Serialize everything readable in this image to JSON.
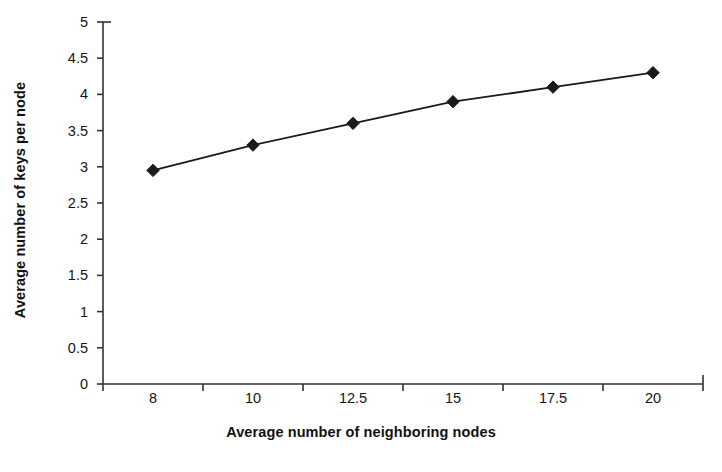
{
  "chart_data": {
    "type": "line",
    "title": "",
    "subtitle": "",
    "xlabel": "Average number of neighboring nodes",
    "ylabel": "Average number of keys per node",
    "categories": [
      "8",
      "10",
      "12.5",
      "15",
      "17.5",
      "20"
    ],
    "values": [
      2.95,
      3.3,
      3.6,
      3.9,
      4.1,
      4.3
    ],
    "series": [
      {
        "name": "Average number of keys per node",
        "values": [
          2.95,
          3.3,
          3.6,
          3.9,
          4.1,
          4.3
        ],
        "marker": "diamond",
        "color": "#1a1a1a"
      }
    ],
    "ylim": [
      0,
      5
    ],
    "y_tick_step": 0.5,
    "y_tick_labels": [
      "5",
      "4.5",
      "4",
      "3.5",
      "3",
      "2.5",
      "2",
      "1.5",
      "1",
      "0.5",
      "0"
    ],
    "grid": false,
    "legend": false,
    "legend_position": "none",
    "annotations": [],
    "plot_background": "#ffffff",
    "axis_color": "#333333",
    "series_color": "#1a1a1a"
  }
}
